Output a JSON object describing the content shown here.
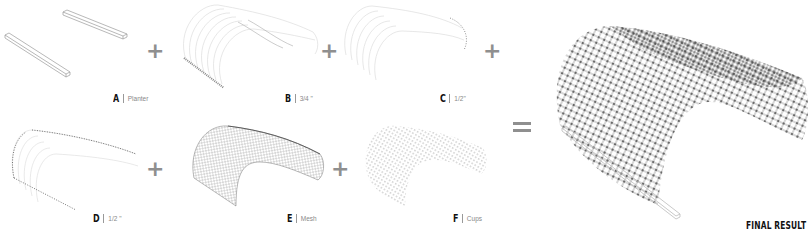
{
  "diagram": {
    "type": "component assembly diagram",
    "panels": [
      {
        "id": "A",
        "letter": "A",
        "desc": "Planter",
        "element": "two planter troughs"
      },
      {
        "id": "B",
        "letter": "B",
        "desc": "3/4 \"",
        "element": "3/4 inch tube arch layer"
      },
      {
        "id": "C",
        "letter": "C",
        "desc": "1/2\"",
        "element": "1/2 inch tube arch layer"
      },
      {
        "id": "D",
        "letter": "D",
        "desc": "1/2 \"",
        "element": "1/2 inch cross tube layer"
      },
      {
        "id": "E",
        "letter": "E",
        "desc": "Mesh",
        "element": "mesh layer"
      },
      {
        "id": "F",
        "letter": "F",
        "desc": "Cups",
        "element": "cups layer"
      }
    ],
    "operators": {
      "plus": "+",
      "equals": "="
    },
    "final": {
      "label": "FINAL RESULT",
      "element": "assembled arched lattice canopy on planter"
    },
    "colors": {
      "background": "#ffffff",
      "operator": "#8f8f8f",
      "label_letter": "#111111",
      "label_desc": "#888888",
      "line_light": "#c8c8c8",
      "line_dark": "#555555"
    }
  }
}
